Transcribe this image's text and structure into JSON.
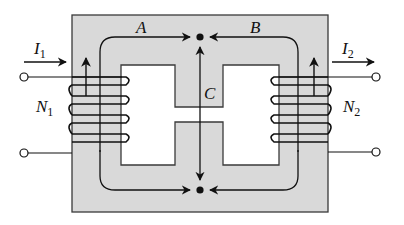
{
  "colors": {
    "core_fill": "#d9d9d9",
    "core_stroke": "#3a3a3a",
    "line": "#111111",
    "window_fill": "#ffffff"
  },
  "labels": {
    "path_a": "A",
    "path_b": "B",
    "path_c": "C",
    "current_1": {
      "main": "I",
      "sub": "1"
    },
    "current_2": {
      "main": "I",
      "sub": "2"
    },
    "turns_1": {
      "main": "N",
      "sub": "1"
    },
    "turns_2": {
      "main": "N",
      "sub": "2"
    }
  },
  "windings": {
    "primary": {
      "turns": 4,
      "flux_arrow": "up"
    },
    "secondary": {
      "turns": 4,
      "flux_arrow": "up"
    }
  },
  "flux_paths": [
    {
      "name": "A",
      "direction": "clockwise toward center limb top node"
    },
    {
      "name": "B",
      "direction": "counter-clockwise toward center limb top node"
    },
    {
      "name": "C",
      "direction": "bidirectional along center limb"
    }
  ],
  "terminals": {
    "left_count": 2,
    "right_count": 2
  }
}
